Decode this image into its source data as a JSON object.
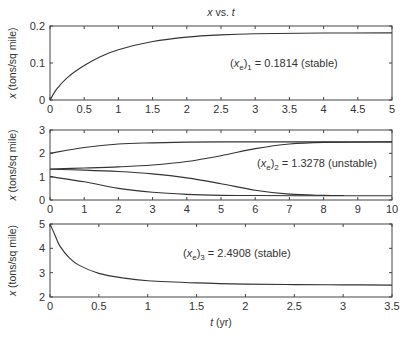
{
  "title": "x vs. t",
  "xlabel": "t (yr)",
  "ylabel": "x (tons/sq mile)",
  "chart_data": [
    {
      "type": "line",
      "title": "x vs. t",
      "xlabel": "",
      "ylabel": "x (tons/sq mile)",
      "xlim": [
        0,
        5
      ],
      "ylim": [
        0,
        0.2
      ],
      "xticks": [
        "0",
        "0.5",
        "1",
        "1.5",
        "2",
        "2.5",
        "3",
        "3.5",
        "4",
        "4.5",
        "5"
      ],
      "yticks": [
        "0",
        "0.1",
        "0.2"
      ],
      "annotation": "(xe)1 = 0.1814 (stable)",
      "series": [
        {
          "name": "x(0)=0",
          "x": [
            0,
            0.1,
            0.25,
            0.5,
            0.75,
            1,
            1.5,
            2,
            2.5,
            3,
            4,
            5
          ],
          "y": [
            0,
            0.03,
            0.06,
            0.093,
            0.118,
            0.136,
            0.158,
            0.17,
            0.176,
            0.179,
            0.181,
            0.1814
          ]
        }
      ]
    },
    {
      "type": "line",
      "xlabel": "",
      "ylabel": "x (tons/sq mile)",
      "xlim": [
        0,
        10
      ],
      "ylim": [
        0,
        3
      ],
      "xticks": [
        "0",
        "1",
        "2",
        "3",
        "4",
        "5",
        "6",
        "7",
        "8",
        "9",
        "10"
      ],
      "yticks": [
        "0",
        "1",
        "2",
        "3"
      ],
      "annotation": "(xe)2 = 1.3278 (unstable)",
      "series": [
        {
          "name": "x(0)=2",
          "x": [
            0,
            1,
            2,
            3,
            4,
            5,
            6,
            8,
            10
          ],
          "y": [
            2.0,
            2.25,
            2.4,
            2.45,
            2.48,
            2.49,
            2.49,
            2.49,
            2.49
          ]
        },
        {
          "name": "x(0)=1.33 (up)",
          "x": [
            0,
            1,
            2,
            3,
            4,
            5,
            6,
            7,
            8,
            10
          ],
          "y": [
            1.33,
            1.37,
            1.42,
            1.5,
            1.65,
            1.9,
            2.2,
            2.4,
            2.47,
            2.49
          ]
        },
        {
          "name": "x(0)=1.32 (down)",
          "x": [
            0,
            1,
            2,
            3,
            4,
            5,
            6,
            7,
            8,
            8.6
          ],
          "y": [
            1.32,
            1.28,
            1.22,
            1.12,
            0.95,
            0.7,
            0.42,
            0.25,
            0.2,
            0.19
          ]
        },
        {
          "name": "x(0)=1",
          "x": [
            0,
            1,
            2,
            3,
            4,
            5,
            6,
            8,
            10
          ],
          "y": [
            1.0,
            0.78,
            0.5,
            0.33,
            0.24,
            0.2,
            0.19,
            0.18,
            0.18
          ]
        }
      ]
    },
    {
      "type": "line",
      "xlabel": "t (yr)",
      "ylabel": "x (tons/sq mile)",
      "xlim": [
        0,
        3.5
      ],
      "ylim": [
        2,
        5
      ],
      "xticks": [
        "0",
        "0.5",
        "1",
        "1.5",
        "2",
        "2.5",
        "3",
        "3.5"
      ],
      "yticks": [
        "2",
        "3",
        "4",
        "5"
      ],
      "annotation": "(xe)3 = 2.4908 (stable)",
      "series": [
        {
          "name": "x(0)=5",
          "x": [
            0,
            0.05,
            0.1,
            0.2,
            0.3,
            0.5,
            0.75,
            1,
            1.5,
            2,
            2.5,
            3,
            3.5
          ],
          "y": [
            5,
            4.55,
            4.1,
            3.6,
            3.3,
            2.97,
            2.78,
            2.67,
            2.58,
            2.53,
            2.51,
            2.5,
            2.49
          ]
        }
      ]
    }
  ],
  "annotations": {
    "p1": {
      "pre": "(x",
      "sub1": "e",
      "mid": ")",
      "sub2": "1",
      "post": " = 0.1814 (stable)"
    },
    "p2": {
      "pre": "(x",
      "sub1": "e",
      "mid": ")",
      "sub2": "2",
      "post": " = 1.3278 (unstable)"
    },
    "p3": {
      "pre": "(x",
      "sub1": "e",
      "mid": ")",
      "sub2": "3",
      "post": " = 2.4908 (stable)"
    }
  }
}
